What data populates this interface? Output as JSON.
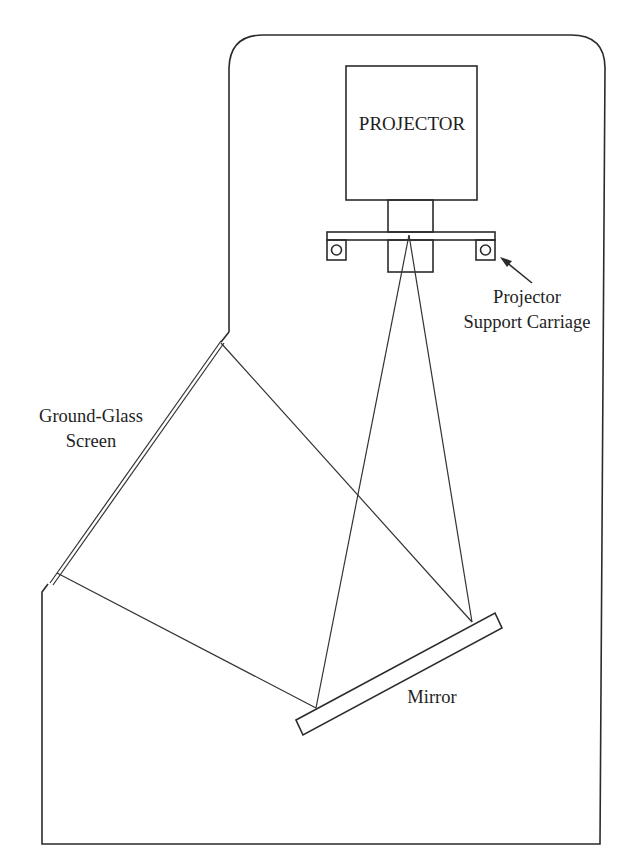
{
  "figure": {
    "type": "schematic",
    "colors": {
      "line": "#2b2b2b",
      "text": "#1e1e1e",
      "background": "#ffffff"
    }
  },
  "labels": {
    "projector": "PROJECTOR",
    "carriage_line1": "Projector",
    "carriage_line2": "Support Carriage",
    "screen_line1": "Ground-Glass",
    "screen_line2": "Screen",
    "mirror": "Mirror"
  },
  "components": [
    {
      "name": "cabinet",
      "label": ""
    },
    {
      "name": "projector",
      "label": "PROJECTOR"
    },
    {
      "name": "projector-lens",
      "label": ""
    },
    {
      "name": "projector-support-carriage",
      "label": "Projector Support Carriage"
    },
    {
      "name": "mirror",
      "label": "Mirror"
    },
    {
      "name": "ground-glass-screen",
      "label": "Ground-Glass Screen"
    }
  ]
}
